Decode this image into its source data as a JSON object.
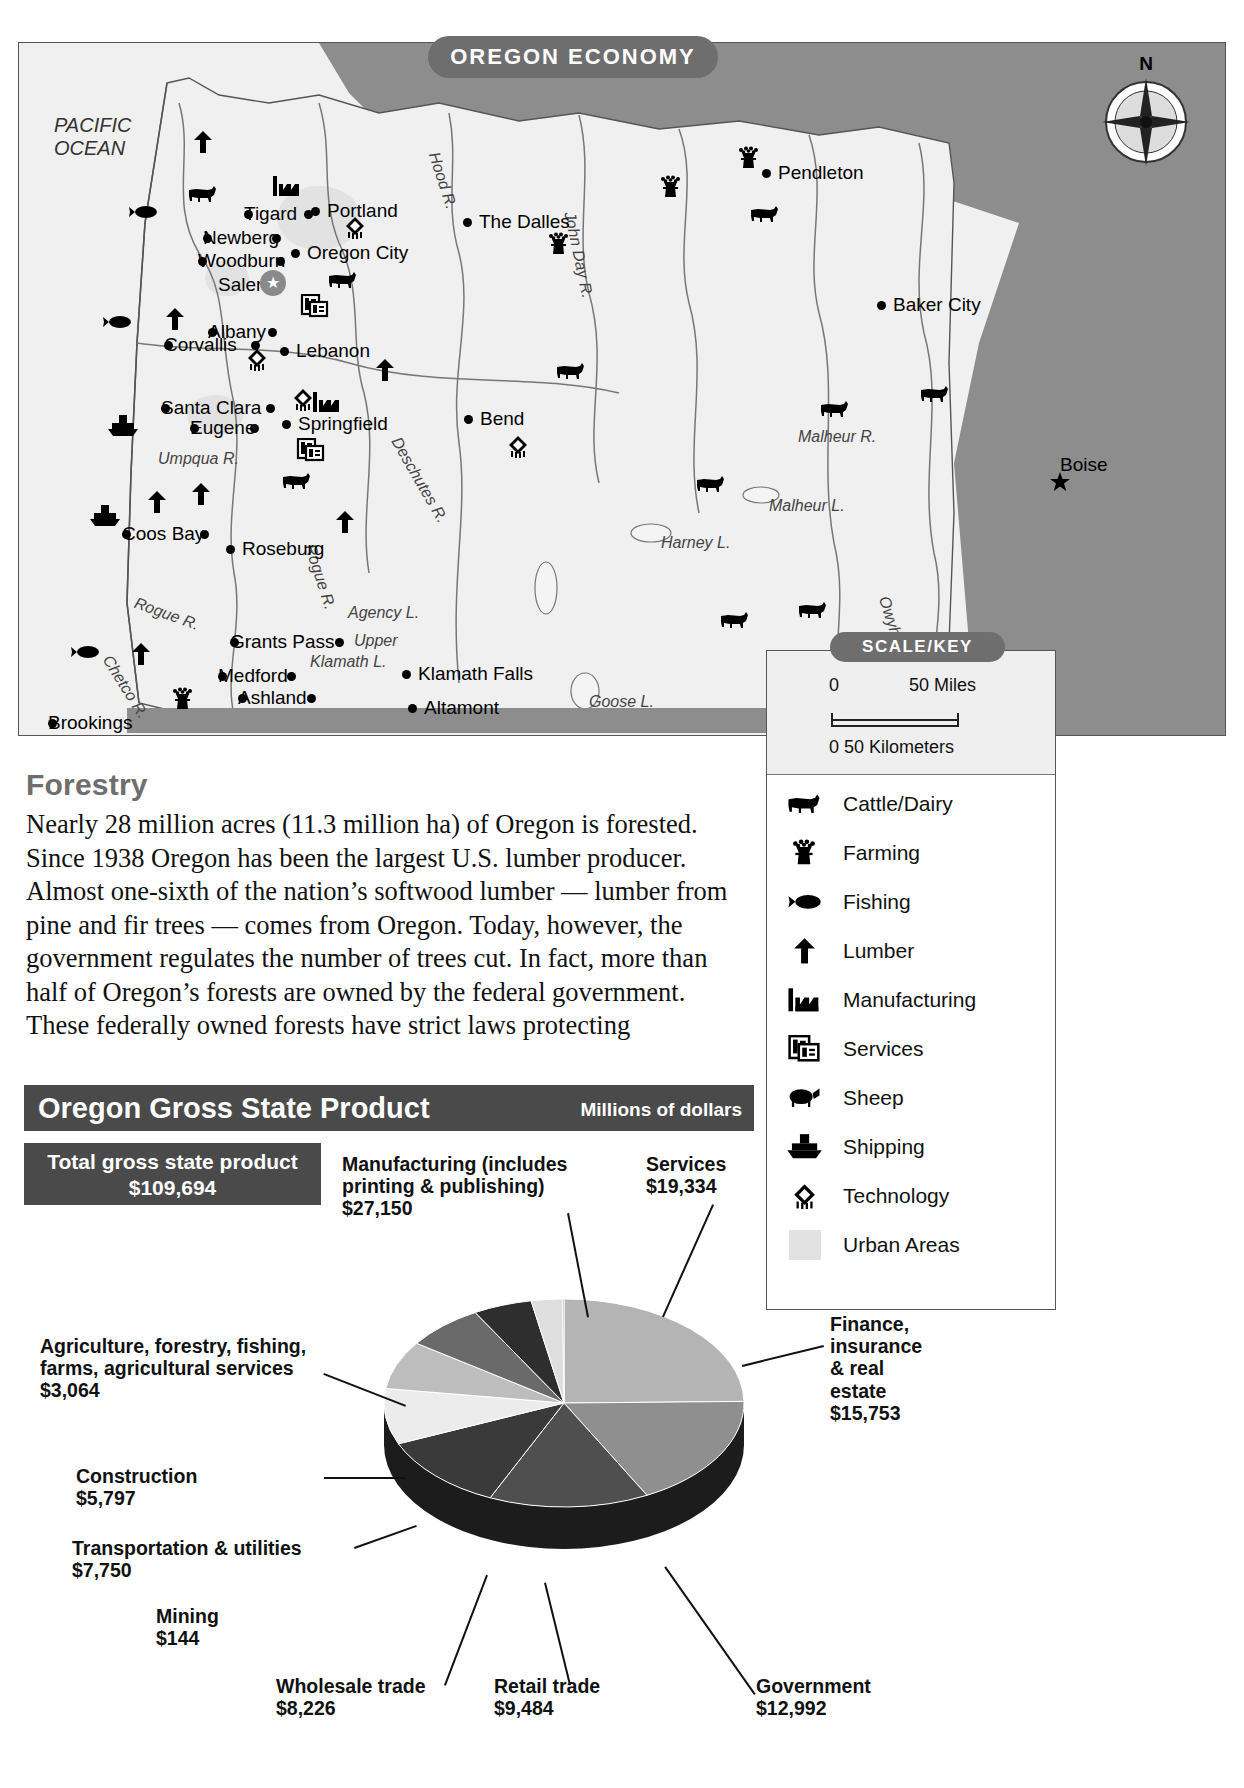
{
  "map": {
    "title": "OREGON ECONOMY",
    "ocean_label_line1": "PACIFIC",
    "ocean_label_line2": "OCEAN",
    "compass_north": "N",
    "cities": [
      {
        "name": "Portland",
        "x": 305,
        "y": 158
      },
      {
        "name": "Tigard",
        "x": 226,
        "y": 161
      },
      {
        "name": "Newberg",
        "x": 185,
        "y": 185
      },
      {
        "name": "Oregon City",
        "x": 285,
        "y": 200
      },
      {
        "name": "Woodburn",
        "x": 180,
        "y": 208
      },
      {
        "name": "Salem",
        "x": 200,
        "y": 232
      },
      {
        "name": "The Dalles",
        "x": 457,
        "y": 169
      },
      {
        "name": "Pendleton",
        "x": 756,
        "y": 120
      },
      {
        "name": "Baker City",
        "x": 871,
        "y": 252
      },
      {
        "name": "Boise",
        "x": 1038,
        "y": 412
      },
      {
        "name": "Albany",
        "x": 190,
        "y": 279
      },
      {
        "name": "Corvallis",
        "x": 146,
        "y": 292
      },
      {
        "name": "Lebanon",
        "x": 274,
        "y": 298
      },
      {
        "name": "Santa Clara",
        "x": 143,
        "y": 355
      },
      {
        "name": "Springfield",
        "x": 276,
        "y": 371
      },
      {
        "name": "Eugene",
        "x": 172,
        "y": 375
      },
      {
        "name": "Bend",
        "x": 458,
        "y": 366
      },
      {
        "name": "Coos Bay",
        "x": 104,
        "y": 481
      },
      {
        "name": "Roseburg",
        "x": 220,
        "y": 496
      },
      {
        "name": "Grants Pass",
        "x": 212,
        "y": 589
      },
      {
        "name": "Medford",
        "x": 200,
        "y": 623
      },
      {
        "name": "Klamath Falls",
        "x": 396,
        "y": 621
      },
      {
        "name": "Ashland",
        "x": 220,
        "y": 645
      },
      {
        "name": "Altamont",
        "x": 402,
        "y": 655
      },
      {
        "name": "Brookings",
        "x": 30,
        "y": 670
      }
    ],
    "water_labels": [
      {
        "name": "Hood R.",
        "x": 424,
        "y": 108,
        "rot": 72
      },
      {
        "name": "John Day R.",
        "x": 560,
        "y": 168,
        "rot": 78
      },
      {
        "name": "Deschutes R.",
        "x": 385,
        "y": 392,
        "rot": 60
      },
      {
        "name": "Umpqua R.",
        "x": 140,
        "y": 408,
        "rot": 0
      },
      {
        "name": "Rogue R.",
        "x": 300,
        "y": 500,
        "rot": 72
      },
      {
        "name": "Rogue R.",
        "x": 120,
        "y": 552,
        "rot": 20
      },
      {
        "name": "Chetco R.",
        "x": 96,
        "y": 610,
        "rot": 58
      },
      {
        "name": "Agency L.",
        "x": 330,
        "y": 562,
        "rot": 0
      },
      {
        "name": "Upper",
        "x": 336,
        "y": 590,
        "rot": 0
      },
      {
        "name": "Klamath L.",
        "x": 292,
        "y": 611,
        "rot": 0
      },
      {
        "name": "Goose L.",
        "x": 571,
        "y": 651,
        "rot": 0
      },
      {
        "name": "Harney L.",
        "x": 643,
        "y": 492,
        "rot": 0
      },
      {
        "name": "Malheur L.",
        "x": 751,
        "y": 455,
        "rot": 0
      },
      {
        "name": "Malheur R.",
        "x": 780,
        "y": 386,
        "rot": 0
      },
      {
        "name": "Owyhee R.",
        "x": 874,
        "y": 552,
        "rot": 72
      }
    ],
    "symbols": [
      {
        "kind": "lumber",
        "x": 168,
        "y": 88
      },
      {
        "kind": "cattle",
        "x": 168,
        "y": 140
      },
      {
        "kind": "fishing",
        "x": 108,
        "y": 158
      },
      {
        "kind": "manufacturing",
        "x": 252,
        "y": 132
      },
      {
        "kind": "technology",
        "x": 320,
        "y": 173
      },
      {
        "kind": "cattle",
        "x": 308,
        "y": 226
      },
      {
        "kind": "services",
        "x": 280,
        "y": 252
      },
      {
        "kind": "fishing",
        "x": 82,
        "y": 268
      },
      {
        "kind": "lumber",
        "x": 140,
        "y": 265
      },
      {
        "kind": "technology",
        "x": 222,
        "y": 305
      },
      {
        "kind": "lumber",
        "x": 350,
        "y": 316
      },
      {
        "kind": "technology",
        "x": 268,
        "y": 345
      },
      {
        "kind": "manufacturing",
        "x": 292,
        "y": 348
      },
      {
        "kind": "shipping",
        "x": 88,
        "y": 372
      },
      {
        "kind": "services",
        "x": 276,
        "y": 396
      },
      {
        "kind": "cattle",
        "x": 262,
        "y": 427
      },
      {
        "kind": "lumber",
        "x": 166,
        "y": 440
      },
      {
        "kind": "shipping",
        "x": 70,
        "y": 462
      },
      {
        "kind": "lumber",
        "x": 122,
        "y": 448
      },
      {
        "kind": "lumber",
        "x": 310,
        "y": 468
      },
      {
        "kind": "fishing",
        "x": 50,
        "y": 598
      },
      {
        "kind": "lumber",
        "x": 106,
        "y": 600
      },
      {
        "kind": "farming",
        "x": 148,
        "y": 645
      },
      {
        "kind": "farming",
        "x": 524,
        "y": 190
      },
      {
        "kind": "farming",
        "x": 636,
        "y": 133
      },
      {
        "kind": "farming",
        "x": 714,
        "y": 104
      },
      {
        "kind": "cattle",
        "x": 730,
        "y": 160
      },
      {
        "kind": "cattle",
        "x": 536,
        "y": 317
      },
      {
        "kind": "technology",
        "x": 483,
        "y": 392
      },
      {
        "kind": "cattle",
        "x": 800,
        "y": 355
      },
      {
        "kind": "cattle",
        "x": 900,
        "y": 340
      },
      {
        "kind": "cattle",
        "x": 676,
        "y": 430
      },
      {
        "kind": "cattle",
        "x": 700,
        "y": 566
      },
      {
        "kind": "cattle",
        "x": 778,
        "y": 556
      }
    ]
  },
  "key": {
    "title": "SCALE/KEY",
    "scale": {
      "miles_zero": "0",
      "miles_label": "50 Miles",
      "km_label": "0  50 Kilometers"
    },
    "items": [
      {
        "icon": "cattle-icon",
        "label": "Cattle/Dairy"
      },
      {
        "icon": "farming-icon",
        "label": "Farming"
      },
      {
        "icon": "fishing-icon",
        "label": "Fishing"
      },
      {
        "icon": "lumber-icon",
        "label": "Lumber"
      },
      {
        "icon": "manufacturing-icon",
        "label": "Manufacturing"
      },
      {
        "icon": "services-icon",
        "label": "Services"
      },
      {
        "icon": "sheep-icon",
        "label": "Sheep"
      },
      {
        "icon": "shipping-icon",
        "label": "Shipping"
      },
      {
        "icon": "technology-icon",
        "label": "Technology"
      },
      {
        "icon": "urban-swatch-icon",
        "label": "Urban Areas"
      }
    ]
  },
  "forestry": {
    "heading": "Forestry",
    "body": "Nearly 28 million acres (11.3 million ha) of Oregon is forested. Since 1938 Oregon has been the largest U.S. lumber producer. Almost one-sixth of the nation’s softwood lumber — lumber from pine and fir trees — comes from Oregon. Today, however, the government regulates the number of trees cut. In fact, more than half of Oregon’s forests are owned by the federal government. These federally owned forests have strict laws protecting"
  },
  "chart_data": {
    "type": "pie",
    "title": "Oregon Gross State Product",
    "subtitle": "Millions of dollars",
    "total_label": "Total gross state product",
    "total_value": "$109,694",
    "categories": [
      "Manufacturing (includes printing & publishing)",
      "Services",
      "Finance, insurance & real estate",
      "Government",
      "Retail trade",
      "Wholesale trade",
      "Transportation & utilities",
      "Construction",
      "Agriculture, forestry, fishing, farms, agricultural services",
      "Mining"
    ],
    "values": [
      27150,
      19334,
      15753,
      12992,
      9484,
      8226,
      7750,
      5797,
      3064,
      144
    ],
    "value_labels": [
      "$27,150",
      "$19,334",
      "$15,753",
      "$12,992",
      "$9,484",
      "$8,226",
      "$7,750",
      "$5,797",
      "$3,064",
      "$144"
    ],
    "labels": [
      {
        "name": "Manufacturing (includes printing & publishing)",
        "amount": "$27,150"
      },
      {
        "name": "Services",
        "amount": "$19,334"
      },
      {
        "name": "Finance, insurance & real estate",
        "amount": "$15,753"
      },
      {
        "name": "Government",
        "amount": "$12,992"
      },
      {
        "name": "Retail trade",
        "amount": "$9,484"
      },
      {
        "name": "Wholesale trade",
        "amount": "$8,226"
      },
      {
        "name": "Transportation & utilities",
        "amount": "$7,750"
      },
      {
        "name": "Construction",
        "amount": "$5,797"
      },
      {
        "name": "Agriculture, forestry, fishing, farms, agricultural services",
        "amount": "$3,064"
      },
      {
        "name": "Mining",
        "amount": "$144"
      }
    ],
    "units": "Millions of dollars",
    "legend": "none"
  },
  "colors": {
    "header_gray": "#4a4a4a",
    "pill_gray": "#6e6e6e",
    "land": "#f0f0f0",
    "neighbor": "#8d8d8d",
    "urban": "#e2e2e2"
  }
}
